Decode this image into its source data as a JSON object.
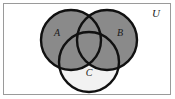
{
  "figure": {
    "kind": "venn-diagram",
    "shaded_expression": "A ∪ B",
    "width": 175,
    "height": 99
  },
  "universe": {
    "label": "U",
    "label_x": 156,
    "label_y": 17,
    "font_size": 11,
    "border_color": "#9a9a9a",
    "background_color": "#ffffff",
    "rect": {
      "x": 3.5,
      "y": 3.5,
      "width": 167,
      "height": 91
    }
  },
  "style": {
    "shaded_fill": "#8a8a8a",
    "unshaded_fill": "#f2f2f2",
    "outline_color": "#111111",
    "outline_width": 2.4,
    "label_color": "#1a1a1a"
  },
  "sets": [
    {
      "name": "A",
      "label": "A",
      "shaded": true,
      "cx": 71,
      "cy": 40,
      "r": 30,
      "label_x": 57,
      "label_y": 36,
      "font_size": 10
    },
    {
      "name": "B",
      "label": "B",
      "shaded": true,
      "cx": 107,
      "cy": 40,
      "r": 30,
      "label_x": 120,
      "label_y": 36,
      "font_size": 10
    },
    {
      "name": "C",
      "label": "C",
      "shaded": false,
      "cx": 89,
      "cy": 62,
      "r": 30,
      "label_x": 89,
      "label_y": 76,
      "font_size": 10
    }
  ],
  "regions": [
    {
      "id": "A-only",
      "shaded": true
    },
    {
      "id": "B-only",
      "shaded": true
    },
    {
      "id": "C-only",
      "shaded": false
    },
    {
      "id": "A-and-B",
      "shaded": true
    },
    {
      "id": "A-and-C",
      "shaded": true
    },
    {
      "id": "B-and-C",
      "shaded": true
    },
    {
      "id": "A-and-B-and-C",
      "shaded": true
    },
    {
      "id": "outside-all",
      "shaded": false
    }
  ]
}
